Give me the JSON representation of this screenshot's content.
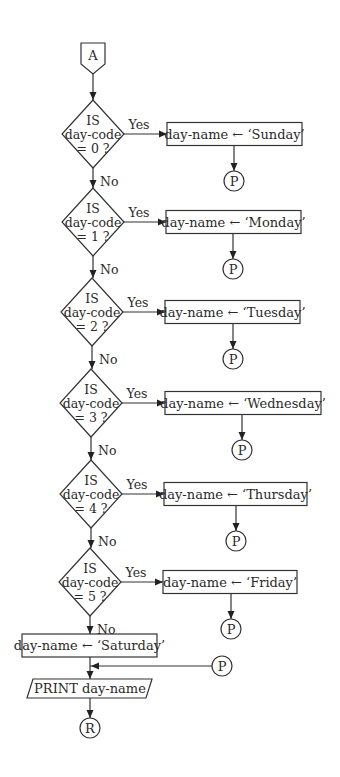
{
  "diagram": {
    "type": "flowchart",
    "start_connector": "A",
    "end_connector": "R",
    "yes_label": "Yes",
    "no_label": "No",
    "page_connector": "P",
    "decisions": [
      {
        "line1": "IS",
        "line2": "day-code",
        "line3": "= 0 ?",
        "action": "day-name ← ‘Sunday’"
      },
      {
        "line1": "IS",
        "line2": "day-code",
        "line3": "= 1 ?",
        "action": "day-name ← ‘Monday’"
      },
      {
        "line1": "IS",
        "line2": "day-code",
        "line3": "= 2 ?",
        "action": "day-name ← ‘Tuesday’"
      },
      {
        "line1": "IS",
        "line2": "day-code",
        "line3": "= 3 ?",
        "action": "day-name ← ‘Wednesday’"
      },
      {
        "line1": "IS",
        "line2": "day-code",
        "line3": "= 4 ?",
        "action": "day-name ← ‘Thursday’"
      },
      {
        "line1": "IS",
        "line2": "day-code",
        "line3": "= 5 ?",
        "action": "day-name ← ‘Friday’"
      }
    ],
    "default_action": "day-name ← ‘Saturday’",
    "output_step": "PRINT day-name"
  }
}
